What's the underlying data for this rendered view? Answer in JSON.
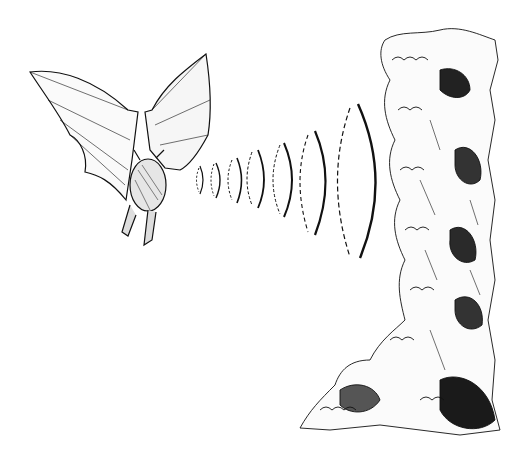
{
  "scene": {
    "description": "Line-art illustration of a bat emitting echolocation sound waves toward foliage",
    "background": "#ffffff",
    "ink": "#111111",
    "elements": [
      "bat",
      "sound-waves",
      "foliage"
    ]
  },
  "waves": {
    "count": 7,
    "style": "dashed left arc, solid right arc"
  }
}
